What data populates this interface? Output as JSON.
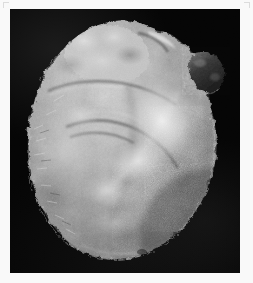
{
  "figure": {
    "domain": "Natural-Image",
    "caption": "",
    "orientation": "anterior view",
    "background_color": "#050505",
    "margin_color": "#f9f9f9",
    "plate": {
      "x": 10,
      "y": 9,
      "width": 230,
      "height": 264
    }
  },
  "specimen": {
    "name": "heart",
    "description": "Fibrinous (bread-and-butter) pericarditis; shaggy irregular epicardial exudate over the ventricular surface",
    "color_mode": "grayscale",
    "tone_range": {
      "darkest": "#1b1b1b",
      "mid": "#8c8c8c",
      "brightest": "#ededed"
    },
    "regions": [
      {
        "id": "base-great-vessels",
        "label": "base with great vessels and epicardial fat",
        "cx": 105,
        "cy": 38,
        "tone": "#b9b9b9"
      },
      {
        "id": "right-atrial-appendage",
        "label": "dark nodular atrial appendage, upper right",
        "cx": 196,
        "cy": 62,
        "tone": "#3c3c3c"
      },
      {
        "id": "left-ventricle-free-wall",
        "label": "left ventricular free wall with shaggy exudate",
        "cx": 78,
        "cy": 150,
        "tone": "#9a9a9a"
      },
      {
        "id": "anterior-interventricular-groove",
        "label": "anterior interventricular groove",
        "cx": 128,
        "cy": 140,
        "tone": "#6b6b6b"
      },
      {
        "id": "fibrin-band",
        "label": "pale fibrinous band, centre right",
        "cx": 155,
        "cy": 120,
        "tone": "#e2e2e2"
      },
      {
        "id": "right-ventricle",
        "label": "right ventricle, granular exudate",
        "cx": 180,
        "cy": 170,
        "tone": "#8f8f8f"
      },
      {
        "id": "apex",
        "label": "cardiac apex, lower margin",
        "cx": 120,
        "cy": 235,
        "tone": "#7d7d7d"
      }
    ]
  },
  "annotations": {
    "labels": [],
    "scale_bar": null,
    "arrows": []
  }
}
